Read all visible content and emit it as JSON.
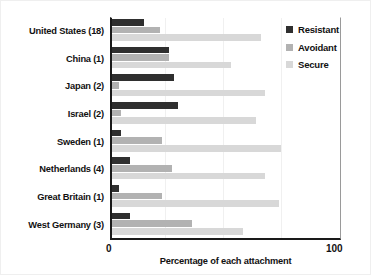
{
  "chart_data": {
    "type": "bar",
    "orientation": "horizontal",
    "title": "",
    "subtitle": "",
    "xlabel": "Percentage of each attachment",
    "ylabel": "",
    "xlim": [
      0,
      100
    ],
    "xticks": [
      "0",
      "100"
    ],
    "grid": true,
    "legend_position": "right",
    "categories": [
      "United States (18)",
      "China (1)",
      "Japan (2)",
      "Israel (2)",
      "Sweden (1)",
      "Netherlands (4)",
      "Great Britain (1)",
      "West Germany (3)"
    ],
    "series": [
      {
        "name": "Resistant",
        "color": "#2f2f2f",
        "values": [
          14,
          25,
          27,
          29,
          4,
          8,
          3,
          8
        ]
      },
      {
        "name": "Avoidant",
        "color": "#b2b2b2",
        "values": [
          21,
          25,
          3,
          4,
          22,
          26,
          22,
          35
        ]
      },
      {
        "name": "Secure",
        "color": "#d8d8d8",
        "values": [
          65,
          52,
          67,
          63,
          74,
          67,
          73,
          57
        ]
      }
    ]
  },
  "axis": {
    "x_min_label": "0",
    "x_max_label": "100",
    "x_title": "Percentage of each attachment"
  },
  "legend": {
    "items": [
      {
        "label": "Resistant",
        "color": "#2f2f2f"
      },
      {
        "label": "Avoidant",
        "color": "#b2b2b2"
      },
      {
        "label": "Secure",
        "color": "#d8d8d8"
      }
    ]
  }
}
